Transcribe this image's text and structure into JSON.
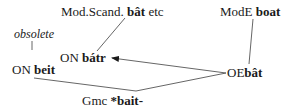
{
  "diagram": {
    "nodes": {
      "mod_scand": {
        "prefix": "Mod.Scand.",
        "word": "bât",
        "suffix": "etc"
      },
      "mod_e": {
        "prefix": "ModE",
        "word": "boat"
      },
      "obsolete": {
        "label": "obsolete"
      },
      "on_batr": {
        "prefix": "ON",
        "word": "bátr"
      },
      "on_beit": {
        "prefix": "ON",
        "word": "beit"
      },
      "oe_bat": {
        "prefix": "OE",
        "word": "bât"
      },
      "gmc": {
        "prefix": "Gmc",
        "word": "*bait-"
      }
    },
    "edges": [
      {
        "from": "mod_scand",
        "to": "on_batr",
        "arrow": false
      },
      {
        "from": "mod_e",
        "to": "oe_bat",
        "arrow": false
      },
      {
        "from": "oe_bat",
        "to": "on_batr",
        "arrow": true
      },
      {
        "from": "obsolete",
        "to": "on_beit",
        "arrow": false
      },
      {
        "from": "on_beit",
        "to": "gmc",
        "arrow": false
      },
      {
        "from": "gmc",
        "to": "oe_bat",
        "arrow": false
      }
    ],
    "line_color": "#555555"
  }
}
